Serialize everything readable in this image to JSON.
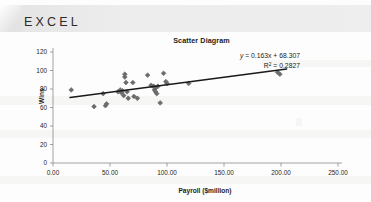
{
  "header": {
    "app_label": "EXCEL"
  },
  "chart_data": {
    "type": "scatter",
    "title": "Scatter Diagram",
    "xlabel": "Payroll ($million)",
    "ylabel": "Wins",
    "xlim": [
      0,
      250
    ],
    "ylim": [
      0,
      120
    ],
    "xticks": [
      "0.00",
      "50.00",
      "100.00",
      "150.00",
      "200.00",
      "250.00"
    ],
    "xtick_values": [
      0,
      50,
      100,
      150,
      200,
      250
    ],
    "yticks": [
      "0",
      "20",
      "40",
      "60",
      "80",
      "100",
      "120"
    ],
    "ytick_values": [
      0,
      20,
      40,
      60,
      80,
      100,
      120
    ],
    "grid": false,
    "legend": "none",
    "marker": "diamond",
    "marker_color": "#6b6b6b",
    "trendline": {
      "show": true,
      "color": "#1a1a1a",
      "slope": 0.163,
      "intercept": 68.307,
      "x_start": 15,
      "x_end": 205
    },
    "annotations": [
      {
        "name": "equation",
        "text": "y = 0.163x + 68.307"
      },
      {
        "name": "r-squared",
        "text": "R² = 0.2827"
      }
    ],
    "equation_display": {
      "y": "y",
      "rest": " = 0.163x + 68.307",
      "r2_prefix": "R",
      "r2_sup": "2",
      "r2_rest": " = 0.2827"
    },
    "points": [
      {
        "x": 16,
        "y": 79
      },
      {
        "x": 36,
        "y": 61
      },
      {
        "x": 44,
        "y": 75
      },
      {
        "x": 46,
        "y": 62
      },
      {
        "x": 47,
        "y": 64
      },
      {
        "x": 57,
        "y": 77
      },
      {
        "x": 59,
        "y": 79
      },
      {
        "x": 60,
        "y": 76
      },
      {
        "x": 61,
        "y": 78
      },
      {
        "x": 62,
        "y": 73
      },
      {
        "x": 63,
        "y": 96
      },
      {
        "x": 63,
        "y": 93
      },
      {
        "x": 64,
        "y": 87
      },
      {
        "x": 65,
        "y": 77
      },
      {
        "x": 66,
        "y": 70
      },
      {
        "x": 70,
        "y": 87
      },
      {
        "x": 71,
        "y": 72
      },
      {
        "x": 74,
        "y": 70
      },
      {
        "x": 83,
        "y": 95
      },
      {
        "x": 86,
        "y": 84
      },
      {
        "x": 88,
        "y": 83
      },
      {
        "x": 89,
        "y": 82
      },
      {
        "x": 89,
        "y": 79
      },
      {
        "x": 90,
        "y": 81
      },
      {
        "x": 90,
        "y": 77
      },
      {
        "x": 91,
        "y": 75
      },
      {
        "x": 92,
        "y": 83
      },
      {
        "x": 94,
        "y": 65
      },
      {
        "x": 97,
        "y": 97
      },
      {
        "x": 99,
        "y": 88
      },
      {
        "x": 100,
        "y": 86
      },
      {
        "x": 119,
        "y": 86
      },
      {
        "x": 197,
        "y": 98
      },
      {
        "x": 199,
        "y": 96
      }
    ]
  }
}
